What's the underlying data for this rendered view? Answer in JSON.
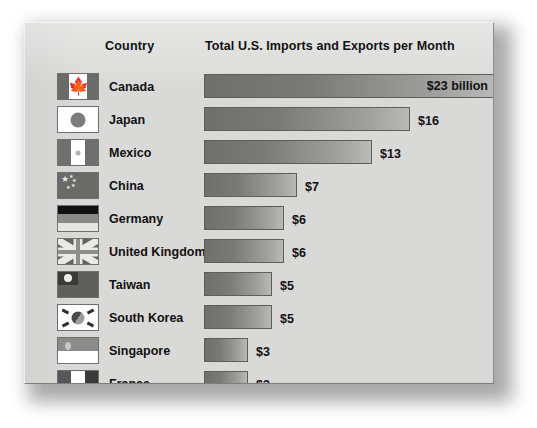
{
  "header": {
    "country_label": "Country",
    "title": "Total U.S. Imports and Exports per Month"
  },
  "chart_data": {
    "type": "bar",
    "title": "Total U.S. Imports and Exports per Month",
    "xlabel": "",
    "ylabel": "Country",
    "orientation": "horizontal",
    "unit": "billions of U.S. dollars per month",
    "xlim": [
      0,
      23
    ],
    "grid": false,
    "legend": null,
    "categories": [
      "Canada",
      "Japan",
      "Mexico",
      "China",
      "Germany",
      "United Kingdom",
      "Taiwan",
      "South Korea",
      "Singapore",
      "France"
    ],
    "values": [
      23,
      16,
      13,
      7,
      6,
      6,
      5,
      5,
      3,
      3
    ],
    "value_labels": [
      "$23 billion",
      "$16",
      "$13",
      "$7",
      "$6",
      "$6",
      "$5",
      "$5",
      "$3",
      "$3"
    ]
  },
  "rows": [
    {
      "country": "Canada",
      "flag": "flag-canada",
      "value": 23,
      "label": "$23 billion",
      "label_inside": true,
      "width_px": 292
    },
    {
      "country": "Japan",
      "flag": "flag-japan",
      "value": 16,
      "label": "$16",
      "label_inside": false,
      "width_px": 206
    },
    {
      "country": "Mexico",
      "flag": "flag-mexico",
      "value": 13,
      "label": "$13",
      "label_inside": false,
      "width_px": 168
    },
    {
      "country": "China",
      "flag": "flag-china",
      "value": 7,
      "label": "$7",
      "label_inside": false,
      "width_px": 93
    },
    {
      "country": "Germany",
      "flag": "flag-germany",
      "value": 6,
      "label": "$6",
      "label_inside": false,
      "width_px": 80
    },
    {
      "country": "United Kingdom",
      "flag": "flag-uk",
      "value": 6,
      "label": "$6",
      "label_inside": false,
      "width_px": 80
    },
    {
      "country": "Taiwan",
      "flag": "flag-taiwan",
      "value": 5,
      "label": "$5",
      "label_inside": false,
      "width_px": 68
    },
    {
      "country": "South Korea",
      "flag": "flag-korea",
      "value": 5,
      "label": "$5",
      "label_inside": false,
      "width_px": 68
    },
    {
      "country": "Singapore",
      "flag": "flag-singapore",
      "value": 3,
      "label": "$3",
      "label_inside": false,
      "width_px": 44
    },
    {
      "country": "France",
      "flag": "flag-france",
      "value": 3,
      "label": "$3",
      "label_inside": false,
      "width_px": 44
    }
  ],
  "colors": {
    "panel_background": "#d9d9d7",
    "page_background": "#ffffff",
    "bar_dark": "#6f6f6d",
    "bar_light": "#b9b9b7",
    "bar_border": "#5d5d5b",
    "text": "#111111"
  }
}
